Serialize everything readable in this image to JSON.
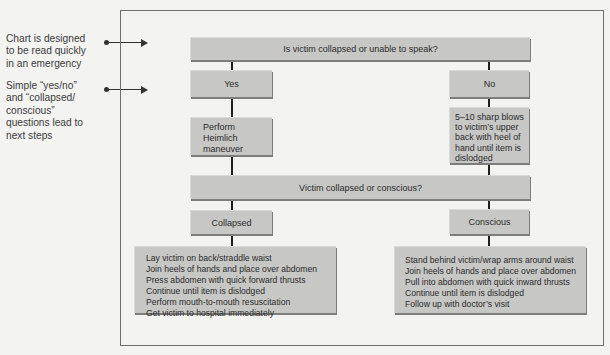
{
  "annotations": [
    {
      "text": "Chart is designed to be read quickly in an emergency",
      "lines": [
        "Chart is designed",
        "to be read quickly",
        "in an emergency"
      ]
    },
    {
      "text": "Simple “yes/no” and “collapsed/ conscious” questions lead to next steps",
      "lines": [
        "Simple “yes/no”",
        "and “collapsed/",
        "conscious”",
        "questions lead to",
        "next steps"
      ]
    }
  ],
  "flowchart": {
    "question_1": "Is victim collapsed or unable to speak?",
    "branch_yes": {
      "label": "Yes",
      "action_lines": [
        "Perform",
        "Heimlich",
        "maneuver"
      ]
    },
    "branch_no": {
      "label": "No",
      "action_lines": [
        "5–10 sharp blows",
        "to victim’s upper",
        "back with heel of",
        "hand until item is",
        "dislodged"
      ]
    },
    "question_2": "Victim collapsed or conscious?",
    "branch_collapsed": {
      "label": "Collapsed",
      "steps": [
        "Lay victim on back/straddle waist",
        "Join heels of hands and place over abdomen",
        "Press abdomen with quick forward thrusts",
        "Continue until item is dislodged",
        "Perform mouth-to-mouth resuscitation",
        "Get victim to hospital immediately"
      ]
    },
    "branch_conscious": {
      "label": "Conscious",
      "steps": [
        "Stand behind victim/wrap arms around waist",
        "Join heels of hands and place over abdomen",
        "Pull into abdomen with quick inward thrusts",
        "Continue until item is dislodged",
        "Follow up with doctor’s visit"
      ]
    }
  },
  "colors": {
    "box_fill": "#c7c7c6",
    "box_shadow": "#7d7d7d",
    "connector": "#1e1e1e",
    "frame": "#6e6e6e",
    "page": "#f3f3f2"
  }
}
